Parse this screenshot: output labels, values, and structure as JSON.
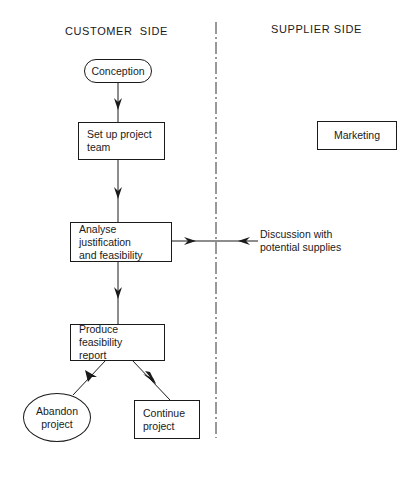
{
  "headers": {
    "customer": "CUSTOMER  SIDE",
    "supplier": "SUPPLIER SIDE"
  },
  "nodes": {
    "conception": {
      "label": "Conception",
      "shape": "rounded"
    },
    "setup_team": {
      "line1": "Set up project",
      "line2": "team",
      "shape": "rect"
    },
    "analyse": {
      "line1": "Analyse justification",
      "line2": "and feasibility",
      "shape": "rect"
    },
    "produce_report": {
      "line1": "Produce feasibility",
      "line2": "report",
      "shape": "rect"
    },
    "abandon": {
      "line1": "Abandon",
      "line2": "project",
      "shape": "ellipse"
    },
    "continue": {
      "line1": "Continue",
      "line2": "project",
      "shape": "rect"
    },
    "marketing": {
      "label": "Marketing",
      "shape": "rect"
    },
    "discussion": {
      "line1": "Discussion with",
      "line2": "potential supplies",
      "shape": "text"
    }
  },
  "edges": [
    {
      "from": "conception",
      "to": "setup_team"
    },
    {
      "from": "setup_team",
      "to": "analyse"
    },
    {
      "from": "analyse",
      "to": "produce_report"
    },
    {
      "from": "produce_report",
      "to": "abandon"
    },
    {
      "from": "produce_report",
      "to": "continue"
    },
    {
      "from": "analyse",
      "to": "discussion",
      "bidirectional": true
    }
  ],
  "divider": {
    "style": "dash-dot",
    "x": 216
  }
}
